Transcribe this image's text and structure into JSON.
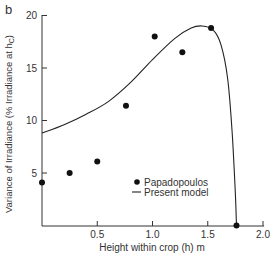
{
  "panel_label": "b",
  "chart_data": {
    "type": "scatter+line",
    "title": "",
    "xlabel": "Height within crop (h) m",
    "ylabel": "Variance of Irradiance (% Irradiance at h",
    "ylabel_sub": "C",
    "ylabel_close": ")",
    "xlim": [
      0,
      2.0
    ],
    "ylim": [
      0,
      20
    ],
    "xticks": [
      0.5,
      1.0,
      1.5,
      2.0
    ],
    "xtick_labels": [
      "0.5",
      "1.0",
      "1.5",
      "2.0"
    ],
    "yticks": [
      5,
      10,
      15,
      20
    ],
    "ytick_labels": [
      "5",
      "10",
      "15",
      "20"
    ],
    "grid": false,
    "legend_position": "lower right (inside)",
    "series": [
      {
        "name": "Papadopoulos",
        "kind": "scatter",
        "marker": "filled-circle",
        "x": [
          0.0,
          0.25,
          0.5,
          0.76,
          1.02,
          1.27,
          1.53,
          1.76
        ],
        "y": [
          4.1,
          5.0,
          6.1,
          11.4,
          18.0,
          16.5,
          18.8,
          0.0
        ]
      },
      {
        "name": "Present model",
        "kind": "line",
        "x": [
          0.0,
          0.2,
          0.4,
          0.6,
          0.8,
          1.0,
          1.2,
          1.35,
          1.45,
          1.55,
          1.62,
          1.68,
          1.72,
          1.75,
          1.76
        ],
        "y": [
          8.8,
          9.6,
          10.6,
          11.8,
          13.6,
          15.8,
          17.8,
          18.8,
          19.0,
          18.6,
          17.2,
          14.0,
          9.0,
          3.0,
          0.0
        ]
      }
    ]
  },
  "legend": {
    "items": [
      {
        "label": "Papadopoulos",
        "symbol": "dot"
      },
      {
        "label": "Present model",
        "symbol": "line"
      }
    ]
  }
}
